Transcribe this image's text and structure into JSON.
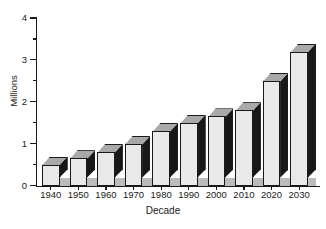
{
  "chart_data": {
    "type": "bar",
    "title": "",
    "xlabel": "Decade",
    "ylabel": "Millions",
    "categories": [
      "1940",
      "1950",
      "1960",
      "1970",
      "1980",
      "1990",
      "2000",
      "2010",
      "2020",
      "2030"
    ],
    "values": [
      0.5,
      0.65,
      0.8,
      1.0,
      1.3,
      1.5,
      1.65,
      1.8,
      2.5,
      3.2
    ],
    "ylim": [
      0,
      4
    ],
    "y_major_ticks": [
      "0",
      "1",
      "2",
      "3",
      "4"
    ],
    "y_major_tick_values": [
      0,
      1,
      2,
      3,
      4
    ],
    "y_minor_tick_values": [
      0.5,
      1.5,
      2.5,
      3.5
    ],
    "grid": false,
    "legend": null,
    "style": "3d-bar",
    "colors": {
      "bar_front": "#e9e9e9",
      "bar_side": "#181818",
      "bar_top": "#a9a9a9",
      "outline": "#1a1a1a",
      "floor": "#bcbcbc",
      "background": "#ffffff"
    }
  }
}
